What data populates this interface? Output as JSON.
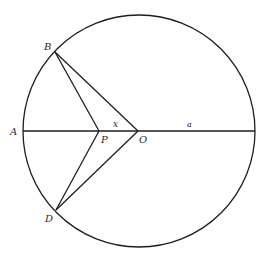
{
  "diagram": {
    "type": "geometry",
    "colors": {
      "stroke": "#1e1e1e",
      "label": "#2a2a2a",
      "background": "#ffffff"
    },
    "circle": {
      "center": "O",
      "radius_label": "a"
    },
    "points": {
      "A": {
        "label": "A"
      },
      "B": {
        "label": "B"
      },
      "D": {
        "label": "D"
      },
      "P": {
        "label": "P"
      },
      "O": {
        "label": "O"
      }
    },
    "segments": [
      {
        "from": "A",
        "to": "right-end",
        "note": "horizontal diameter"
      },
      {
        "from": "B",
        "to": "P"
      },
      {
        "from": "B",
        "to": "O"
      },
      {
        "from": "D",
        "to": "P"
      },
      {
        "from": "D",
        "to": "O"
      }
    ],
    "segment_labels": {
      "PO": "x",
      "O_to_edge": "a"
    }
  }
}
